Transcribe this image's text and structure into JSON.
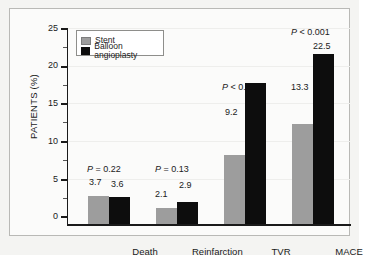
{
  "chart_data": {
    "type": "bar",
    "title": "",
    "xlabel": "",
    "ylabel": "PATIENTS (%)",
    "ylim": [
      0,
      26
    ],
    "yticks": [
      0,
      5,
      10,
      15,
      20,
      25
    ],
    "ytick_labels": [
      "0",
      "5",
      "10",
      "15",
      "20",
      "25"
    ],
    "minor_ticks": [
      2.5,
      7.5,
      12.5,
      17.5,
      22.5
    ],
    "grid": true,
    "legend_position": "top-left",
    "categories": [
      "Death",
      "Reinfarction",
      "TVR",
      "MACE"
    ],
    "series": [
      {
        "name": "Stent",
        "color": "#9d9d9d",
        "values": [
          3.7,
          2.1,
          9.2,
          13.3
        ]
      },
      {
        "name": "Balloon angioplasty",
        "color": "#0d0d0d",
        "values": [
          3.6,
          2.9,
          18.7,
          22.5
        ]
      }
    ],
    "value_labels": {
      "stent": [
        "3.7",
        "2.1",
        "9.2",
        "13.3"
      ],
      "balloon": [
        "3.6",
        "2.9",
        "18.7",
        "22.5"
      ]
    },
    "annotations": [
      {
        "category": "Death",
        "prefix": "P",
        "relation": "=",
        "value": "0.22"
      },
      {
        "category": "Reinfarction",
        "prefix": "P",
        "relation": "=",
        "value": "0.13"
      },
      {
        "category": "TVR",
        "prefix": "P",
        "relation": "<",
        "value": "0.001"
      },
      {
        "category": "MACE",
        "prefix": "P",
        "relation": "<",
        "value": "0.001"
      }
    ]
  },
  "legend": {
    "items": [
      {
        "label": "Stent",
        "swatch": "gray-swatch"
      },
      {
        "label": "Balloon angioplasty",
        "swatch": "black-swatch"
      }
    ]
  },
  "axis": {
    "y_title": "PATIENTS (%)",
    "y_labels": [
      "25",
      "20",
      "15",
      "10",
      "5",
      "0"
    ]
  },
  "p_values": {
    "death": "P = 0.22",
    "reinfarction": "P = 0.13",
    "tvr": "P < 0.001",
    "mace": "P < 0.001"
  }
}
